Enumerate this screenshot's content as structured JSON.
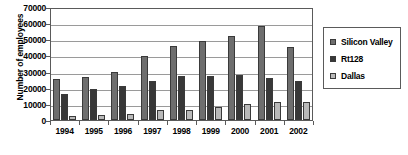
{
  "chart_data": {
    "type": "bar",
    "title": "",
    "xlabel": "",
    "ylabel": "Number of employees",
    "categories": [
      "1994",
      "1995",
      "1996",
      "1997",
      "1998",
      "1999",
      "2000",
      "2001",
      "2002"
    ],
    "series": [
      {
        "name": "Silicon Valley",
        "color": "#6e6e6e",
        "values": [
          25500,
          26500,
          30000,
          39500,
          46000,
          49000,
          52000,
          58000,
          45000
        ]
      },
      {
        "name": "Rt128",
        "color": "#383838",
        "values": [
          16000,
          19000,
          21000,
          24000,
          27000,
          27000,
          28000,
          26000,
          24000
        ]
      },
      {
        "name": "Dallas",
        "color": "#b9b9b9",
        "values": [
          2500,
          3000,
          3500,
          6000,
          6500,
          8000,
          10000,
          11000,
          11000
        ]
      }
    ],
    "ylim": [
      0,
      70000
    ],
    "ytick_labels": [
      "0",
      "10000",
      "20000",
      "30000",
      "40000",
      "50000",
      "60000",
      "70000"
    ],
    "ytick_values": [
      0,
      10000,
      20000,
      30000,
      40000,
      50000,
      60000,
      70000
    ],
    "grid": true,
    "legend_position": "right"
  }
}
